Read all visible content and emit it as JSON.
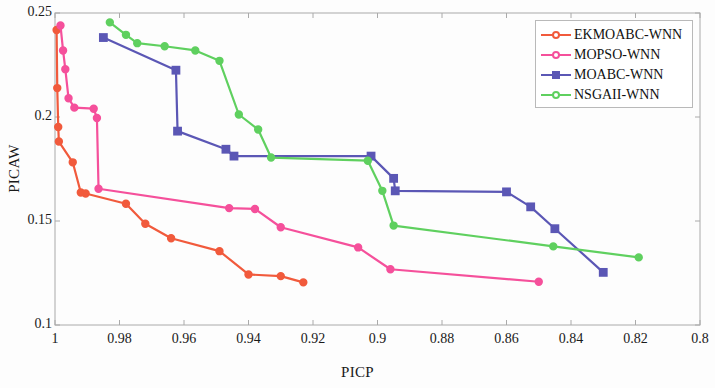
{
  "chart_data": {
    "type": "line",
    "title": "",
    "xlabel": "PICP",
    "ylabel": "PICAW",
    "xlim": [
      1.0,
      0.8
    ],
    "ylim": [
      0.1,
      0.25
    ],
    "x_reversed": true,
    "grid": false,
    "legend_position": "top-right",
    "xticks": [
      "1",
      "0.98",
      "0.96",
      "0.94",
      "0.92",
      "0.9",
      "0.88",
      "0.86",
      "0.84",
      "0.82",
      "0.8"
    ],
    "xtick_values": [
      1.0,
      0.98,
      0.96,
      0.94,
      0.92,
      0.9,
      0.88,
      0.86,
      0.84,
      0.82,
      0.8
    ],
    "yticks": [
      "0.1",
      "0.15",
      "0.2",
      "0.25"
    ],
    "ytick_values": [
      0.1,
      0.15,
      0.2,
      0.25
    ],
    "series": [
      {
        "name": "EKMOABC-WNN",
        "color": "#F15A3C",
        "marker": "circle",
        "points": [
          [
            0.9995,
            0.2418
          ],
          [
            0.9993,
            0.2139
          ],
          [
            0.999,
            0.1952
          ],
          [
            0.9988,
            0.1882
          ],
          [
            0.9945,
            0.1782
          ],
          [
            0.992,
            0.1637
          ],
          [
            0.9905,
            0.1632
          ],
          [
            0.978,
            0.1583
          ],
          [
            0.972,
            0.1487
          ],
          [
            0.964,
            0.1417
          ],
          [
            0.949,
            0.1355
          ],
          [
            0.94,
            0.1243
          ],
          [
            0.93,
            0.1235
          ],
          [
            0.923,
            0.1205
          ]
        ]
      },
      {
        "name": "MOPSO-WNN",
        "color": "#F5509B",
        "marker": "circle",
        "points": [
          [
            0.9983,
            0.244
          ],
          [
            0.9975,
            0.232
          ],
          [
            0.9968,
            0.223
          ],
          [
            0.9958,
            0.209
          ],
          [
            0.994,
            0.2045
          ],
          [
            0.988,
            0.204
          ],
          [
            0.987,
            0.1995
          ],
          [
            0.9865,
            0.1655
          ],
          [
            0.946,
            0.1562
          ],
          [
            0.938,
            0.1558
          ],
          [
            0.93,
            0.147
          ],
          [
            0.906,
            0.1373
          ],
          [
            0.896,
            0.1268
          ],
          [
            0.85,
            0.1208
          ]
        ]
      },
      {
        "name": "MOABC-WNN",
        "color": "#5B57B5",
        "marker": "square",
        "points": [
          [
            0.985,
            0.2382
          ],
          [
            0.9625,
            0.2225
          ],
          [
            0.962,
            0.1932
          ],
          [
            0.947,
            0.1845
          ],
          [
            0.9445,
            0.1812
          ],
          [
            0.902,
            0.1812
          ],
          [
            0.895,
            0.1705
          ],
          [
            0.8945,
            0.1645
          ],
          [
            0.86,
            0.164
          ],
          [
            0.8525,
            0.1568
          ],
          [
            0.845,
            0.1463
          ],
          [
            0.83,
            0.1253
          ]
        ]
      },
      {
        "name": "NSGAII-WNN",
        "color": "#5FD05F",
        "marker": "circle",
        "points": [
          [
            0.983,
            0.2455
          ],
          [
            0.978,
            0.2395
          ],
          [
            0.9745,
            0.2355
          ],
          [
            0.966,
            0.234
          ],
          [
            0.9565,
            0.232
          ],
          [
            0.949,
            0.227
          ],
          [
            0.943,
            0.2012
          ],
          [
            0.937,
            0.194
          ],
          [
            0.933,
            0.1805
          ],
          [
            0.903,
            0.179
          ],
          [
            0.8985,
            0.1645
          ],
          [
            0.895,
            0.1478
          ],
          [
            0.8455,
            0.1378
          ],
          [
            0.819,
            0.1325
          ]
        ]
      }
    ]
  },
  "legend": {
    "items": [
      {
        "label": "EKMOABC-WNN",
        "color": "#F15A3C",
        "marker": "circle"
      },
      {
        "label": "MOPSO-WNN",
        "color": "#F5509B",
        "marker": "circle"
      },
      {
        "label": "MOABC-WNN",
        "color": "#5B57B5",
        "marker": "square"
      },
      {
        "label": "NSGAII-WNN",
        "color": "#5FD05F",
        "marker": "circle"
      }
    ]
  },
  "axes": {
    "x_title": "PICP",
    "y_title": "PICAW",
    "frame_color": "#aaaaaa"
  }
}
